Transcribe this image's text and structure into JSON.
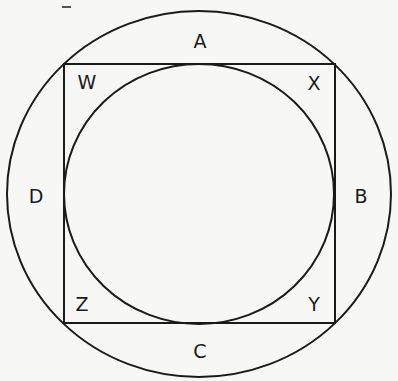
{
  "diagram": {
    "colors": {
      "background": "#f7f7f5",
      "stroke": "#1a1a1a"
    },
    "outer_circle": {
      "cx": 199,
      "cy": 194,
      "rx": 192,
      "ry": 183
    },
    "square": {
      "x": 64,
      "y": 64,
      "width": 271,
      "height": 259
    },
    "inner_circle": {
      "cx": 199,
      "cy": 194,
      "rx": 135,
      "ry": 130
    },
    "labels": {
      "A": "A",
      "B": "B",
      "C": "C",
      "D": "D",
      "W": "W",
      "X": "X",
      "Y": "Y",
      "Z": "Z"
    }
  }
}
